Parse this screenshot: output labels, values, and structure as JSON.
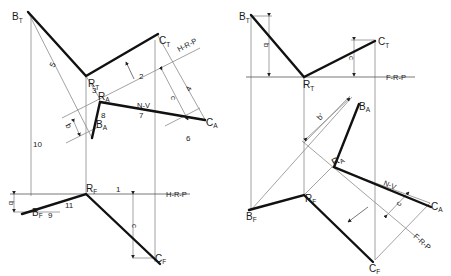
{
  "figure": {
    "type": "descriptive-geometry",
    "colors": {
      "object_line": "#111111",
      "construction_line": "#8a8a8a",
      "background": "#ffffff"
    }
  },
  "left_view": {
    "points": {
      "BT": {
        "main": "B",
        "sub": "T"
      },
      "RT": {
        "main": "R",
        "sub": "T"
      },
      "CT": {
        "main": "C",
        "sub": "T"
      },
      "RA": {
        "main": "R",
        "sub": "A"
      },
      "BA": {
        "main": "B",
        "sub": "A"
      },
      "CA": {
        "main": "C",
        "sub": "A"
      },
      "RF": {
        "main": "R",
        "sub": "F"
      },
      "BF": {
        "main": "B",
        "sub": "F"
      },
      "CF": {
        "main": "C",
        "sub": "F"
      }
    },
    "plane_labels": {
      "top": "H-R-P",
      "bottom": "H-R-P",
      "normal_view": "N-V"
    },
    "step_numbers": [
      "1",
      "2",
      "3",
      "4",
      "5",
      "6",
      "7",
      "8",
      "9",
      "10",
      "11"
    ],
    "dims": {
      "b": "b",
      "c": "c"
    }
  },
  "right_view": {
    "points": {
      "BT": {
        "main": "B",
        "sub": "T"
      },
      "RT": {
        "main": "R",
        "sub": "T"
      },
      "CT": {
        "main": "C",
        "sub": "T"
      },
      "BA": {
        "main": "B",
        "sub": "A"
      },
      "RA": {
        "main": "R",
        "sub": "A"
      },
      "CA": {
        "main": "C",
        "sub": "A"
      },
      "RF": {
        "main": "R",
        "sub": "F"
      },
      "BF": {
        "main": "B",
        "sub": "F"
      },
      "CF": {
        "main": "C",
        "sub": "F"
      }
    },
    "plane_labels": {
      "top": "F-R-P",
      "bottom": "F-R-P",
      "normal_view": "N-V"
    },
    "dims": {
      "b": "b",
      "b_prime": "b'",
      "c": "c"
    }
  }
}
